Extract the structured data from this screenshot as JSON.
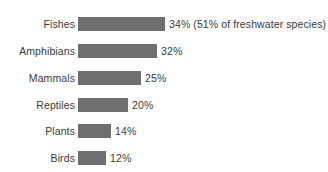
{
  "chart_data": {
    "type": "bar",
    "orientation": "horizontal",
    "title": "",
    "subtitle": "",
    "xlabel": "",
    "ylabel": "",
    "grid": false,
    "legend": false,
    "axis_visible": false,
    "xlim": [
      0,
      34
    ],
    "categories": [
      "Fishes",
      "Amphibians",
      "Mammals",
      "Reptiles",
      "Plants",
      "Birds"
    ],
    "values": [
      34,
      32,
      25,
      20,
      14,
      12
    ],
    "value_labels": [
      "34% (51% of freshwater species)",
      "32%",
      "25%",
      "20%",
      "14%",
      "12%"
    ],
    "annotations": [
      "51% of freshwater species"
    ],
    "bar_color": "#6f6f6f",
    "text_color": "#3a3a3a",
    "background_color": "#ffffff",
    "bars": [
      {
        "category": "Fishes",
        "value": 34,
        "label": "34% (51% of freshwater species)",
        "bar_px": 87,
        "top_px": 17
      },
      {
        "category": "Amphibians",
        "value": 32,
        "label": "32%",
        "bar_px": 79,
        "top_px": 44
      },
      {
        "category": "Mammals",
        "value": 25,
        "label": "25%",
        "bar_px": 63,
        "top_px": 71
      },
      {
        "category": "Reptiles",
        "value": 20,
        "label": "20%",
        "bar_px": 50,
        "top_px": 98
      },
      {
        "category": "Plants",
        "value": 14,
        "label": "14%",
        "bar_px": 33,
        "top_px": 124
      },
      {
        "category": "Birds",
        "value": 12,
        "label": "12%",
        "bar_px": 28,
        "top_px": 151
      }
    ]
  }
}
